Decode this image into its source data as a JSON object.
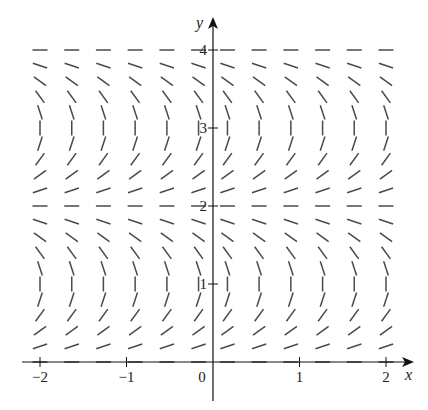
{
  "chart_data": {
    "type": "slope_field",
    "title": "",
    "xlabel": "x",
    "ylabel": "y",
    "xlim": [
      -2.05,
      2.05
    ],
    "ylim": [
      0,
      4
    ],
    "x_ticks": [
      {
        "value": -2,
        "label": "−2"
      },
      {
        "value": -1,
        "label": "−1"
      },
      {
        "value": 0,
        "label": "0"
      },
      {
        "value": 1,
        "label": "1"
      },
      {
        "value": 2,
        "label": "2"
      }
    ],
    "y_ticks": [
      {
        "value": 1,
        "label": "1"
      },
      {
        "value": 2,
        "label": "2"
      },
      {
        "value": 3,
        "label": "3"
      },
      {
        "value": 4,
        "label": "4"
      }
    ],
    "grid": false,
    "legend": null,
    "equilibrium_y": [
      0,
      2,
      4
    ],
    "vertical_slope_y": [
      1,
      3
    ],
    "sample_x": [
      -2.0,
      -1.633,
      -1.267,
      -0.9,
      -0.533,
      -0.167,
      0.167,
      0.533,
      0.9,
      1.267,
      1.633,
      2.0
    ],
    "sample_y": [
      0,
      0.2,
      0.4,
      0.6,
      0.8,
      1.0,
      1.2,
      1.4,
      1.6,
      1.8,
      2.0,
      2.2,
      2.4,
      2.6,
      2.8,
      3.0,
      3.2,
      3.4,
      3.6,
      3.8,
      4.0
    ],
    "segment_angle_deg_by_y": [
      0,
      18,
      36,
      54,
      72,
      90,
      108,
      126,
      144,
      162,
      180,
      198,
      216,
      234,
      252,
      270,
      288,
      306,
      324,
      342,
      360
    ]
  },
  "style": {
    "segment_color": "#4a4a4a",
    "axis_color": "#111111"
  }
}
